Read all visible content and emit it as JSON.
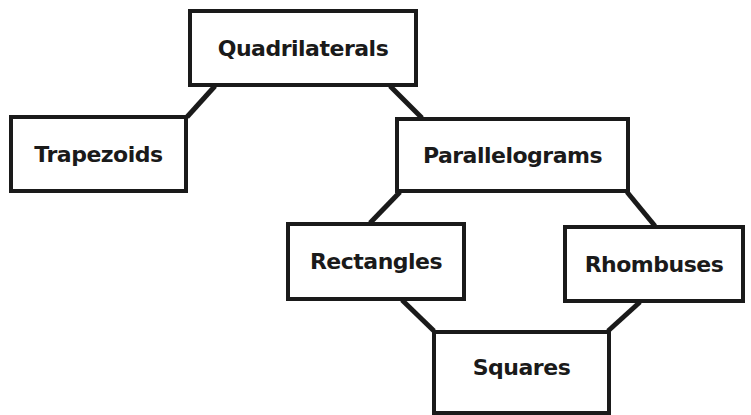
{
  "diagram": {
    "nodes": [
      {
        "id": "quadrilaterals",
        "label": "Quadrilaterals"
      },
      {
        "id": "trapezoids",
        "label": "Trapezoids"
      },
      {
        "id": "parallelograms",
        "label": "Parallelograms"
      },
      {
        "id": "rectangles",
        "label": "Rectangles"
      },
      {
        "id": "rhombuses",
        "label": "Rhombuses"
      },
      {
        "id": "squares",
        "label": "Squares"
      }
    ],
    "edges": [
      {
        "from": "quadrilaterals",
        "to": "trapezoids"
      },
      {
        "from": "quadrilaterals",
        "to": "parallelograms"
      },
      {
        "from": "parallelograms",
        "to": "rectangles"
      },
      {
        "from": "parallelograms",
        "to": "rhombuses"
      },
      {
        "from": "rectangles",
        "to": "squares"
      },
      {
        "from": "rhombuses",
        "to": "squares"
      }
    ],
    "colors": {
      "stroke": "#1a1a1a",
      "background": "#ffffff"
    }
  }
}
